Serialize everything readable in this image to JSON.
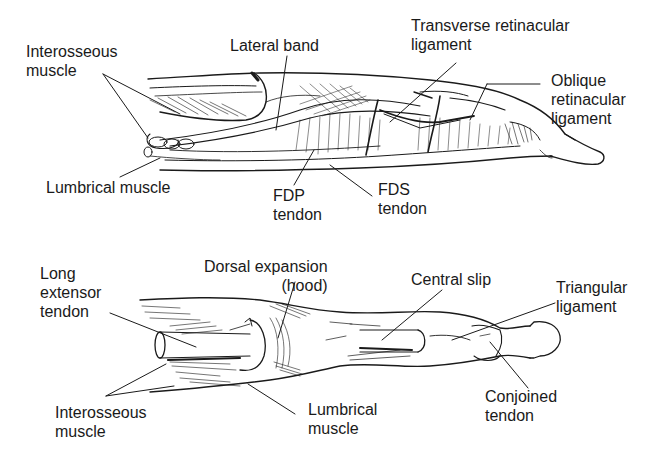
{
  "diagram": {
    "top_view": {
      "name": "Lateral view of finger extensor mechanism",
      "labels": [
        {
          "id": "interosseous-muscle-top",
          "lines": [
            "Interosseous",
            "muscle"
          ]
        },
        {
          "id": "lateral-band",
          "lines": [
            "Lateral band"
          ]
        },
        {
          "id": "transverse-retinacular-ligament",
          "lines": [
            "Transverse retinacular",
            "ligament"
          ]
        },
        {
          "id": "oblique-retinacular-ligament",
          "lines": [
            "Oblique",
            "retinacular",
            "ligament"
          ]
        },
        {
          "id": "lumbrical-muscle-top",
          "lines": [
            "Lumbrical muscle"
          ]
        },
        {
          "id": "fdp-tendon",
          "lines": [
            "FDP",
            "tendon"
          ]
        },
        {
          "id": "fds-tendon",
          "lines": [
            "FDS",
            "tendon"
          ]
        }
      ]
    },
    "bottom_view": {
      "name": "Dorsal view of finger extensor mechanism",
      "labels": [
        {
          "id": "long-extensor-tendon",
          "lines": [
            "Long",
            "extensor",
            "tendon"
          ]
        },
        {
          "id": "dorsal-expansion",
          "lines": [
            "Dorsal expansion",
            "(hood)"
          ]
        },
        {
          "id": "central-slip",
          "lines": [
            "Central slip"
          ]
        },
        {
          "id": "triangular-ligament",
          "lines": [
            "Triangular",
            "ligament"
          ]
        },
        {
          "id": "interosseous-muscle-bottom",
          "lines": [
            "Interosseous",
            "muscle"
          ]
        },
        {
          "id": "lumbrical-muscle-bottom",
          "lines": [
            "Lumbrical",
            "muscle"
          ]
        },
        {
          "id": "conjoined-tendon",
          "lines": [
            "Conjoined",
            "tendon"
          ]
        }
      ]
    },
    "colors": {
      "ink": "#1a1a1a",
      "background": "#ffffff"
    }
  }
}
